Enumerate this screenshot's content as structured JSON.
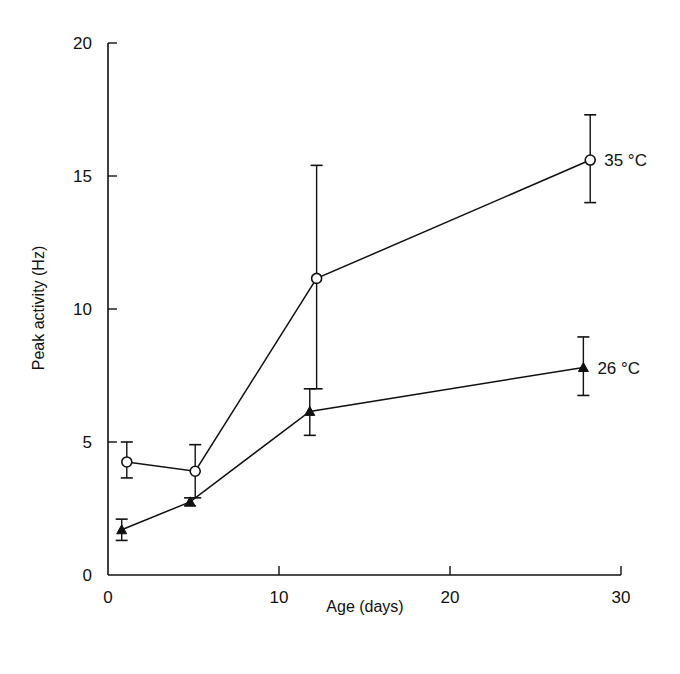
{
  "chart_data": {
    "type": "line",
    "title": "",
    "xlabel": "Age (days)",
    "ylabel": "Peak activity (Hz)",
    "xlim": [
      0,
      30
    ],
    "ylim": [
      0,
      20
    ],
    "xticks": [
      0,
      10,
      20,
      30
    ],
    "yticks": [
      0,
      5,
      10,
      15,
      20
    ],
    "grid": false,
    "legend_position": "inline labels at right end of each series",
    "series": [
      {
        "name": "35 °C",
        "label": "35 °C",
        "marker": "open-circle",
        "x": [
          1.1,
          5.1,
          12.2,
          28.2
        ],
        "y": [
          4.25,
          3.9,
          11.15,
          15.6
        ],
        "err_low": [
          3.65,
          2.9,
          7.0,
          14.0
        ],
        "err_high": [
          5.0,
          4.9,
          15.4,
          17.3
        ]
      },
      {
        "name": "26 °C",
        "label": "26 °C",
        "marker": "filled-triangle",
        "x": [
          0.8,
          4.8,
          11.8,
          27.8
        ],
        "y": [
          1.7,
          2.75,
          6.15,
          7.8
        ],
        "err_low": [
          1.3,
          2.6,
          5.25,
          6.75
        ],
        "err_high": [
          2.1,
          2.9,
          7.0,
          8.95
        ]
      }
    ]
  },
  "colors": {
    "ink": "#111111",
    "background": "#ffffff"
  }
}
